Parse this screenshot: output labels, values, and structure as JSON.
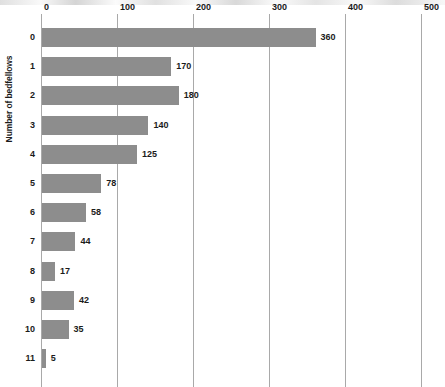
{
  "chart_data": {
    "type": "bar",
    "orientation": "horizontal",
    "title": "",
    "xlabel": "",
    "ylabel": "Number of bedfellows",
    "categories": [
      "0",
      "1",
      "2",
      "3",
      "4",
      "5",
      "6",
      "7",
      "8",
      "9",
      "10",
      "11"
    ],
    "values": [
      360,
      170,
      180,
      140,
      125,
      78,
      58,
      44,
      17,
      42,
      35,
      5
    ],
    "value_labels": [
      "360",
      "170",
      "180",
      "140",
      "125",
      "78",
      "58",
      "44",
      "17",
      "42",
      "35",
      "5"
    ],
    "xlim": [
      0,
      500
    ],
    "xticks": [
      0,
      100,
      200,
      300,
      400,
      500
    ],
    "xtick_labels": [
      "0",
      "100",
      "200",
      "300",
      "400",
      "500"
    ],
    "grid": "vertical",
    "legend": "none",
    "bar_color": "#8d8d8d",
    "gridline_color": "#a9a9a9",
    "axis_color": "#6d6d6d",
    "text_color": "#1b1b1b",
    "background": "#ffffff"
  }
}
